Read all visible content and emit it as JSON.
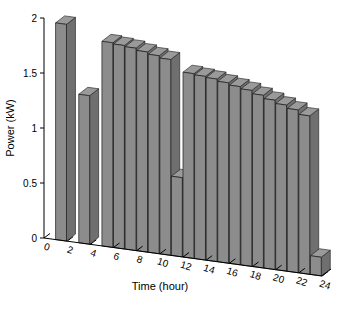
{
  "chart_data": {
    "type": "bar",
    "title": "",
    "subtitle": "",
    "xlabel": "Time (hour)",
    "ylabel": "Power (kW)",
    "xlim": [
      0,
      24
    ],
    "ylim": [
      0,
      2
    ],
    "grid": false,
    "legend": null,
    "projection": "3d-bar",
    "xticks": [
      0,
      2,
      4,
      6,
      8,
      10,
      12,
      14,
      16,
      18,
      20,
      22,
      24
    ],
    "xtick_labels": [
      "0",
      "2",
      "4",
      "6",
      "8",
      "10",
      "12",
      "14",
      "16",
      "18",
      "20",
      "22",
      "24"
    ],
    "yticks": [
      0,
      0.5,
      1,
      1.5,
      2
    ],
    "ytick_labels": [
      "0",
      "0.5",
      "1",
      "1.5",
      "2"
    ],
    "categories": [
      1,
      2,
      3,
      4,
      5,
      6,
      7,
      8,
      9,
      10,
      11,
      12,
      13,
      14,
      15,
      16,
      17,
      18,
      19,
      20,
      21,
      22,
      23,
      24
    ],
    "values": [
      0,
      1.97,
      0,
      1.35,
      0,
      1.86,
      1.85,
      1.84,
      1.82,
      1.8,
      1.78,
      0.72,
      1.68,
      1.67,
      1.66,
      1.64,
      1.62,
      1.6,
      1.57,
      1.54,
      1.51,
      1.48,
      1.44,
      0.17
    ],
    "bar_face_color": "#8c8c8c",
    "bar_top_color": "#9a9a9a",
    "bar_side_color": "#6f6f6f",
    "bar_edge_color": "#1a1a1a",
    "axis_color": "#000000",
    "background_color": "#ffffff"
  },
  "figure": {
    "name": "power-time-bar-chart"
  }
}
